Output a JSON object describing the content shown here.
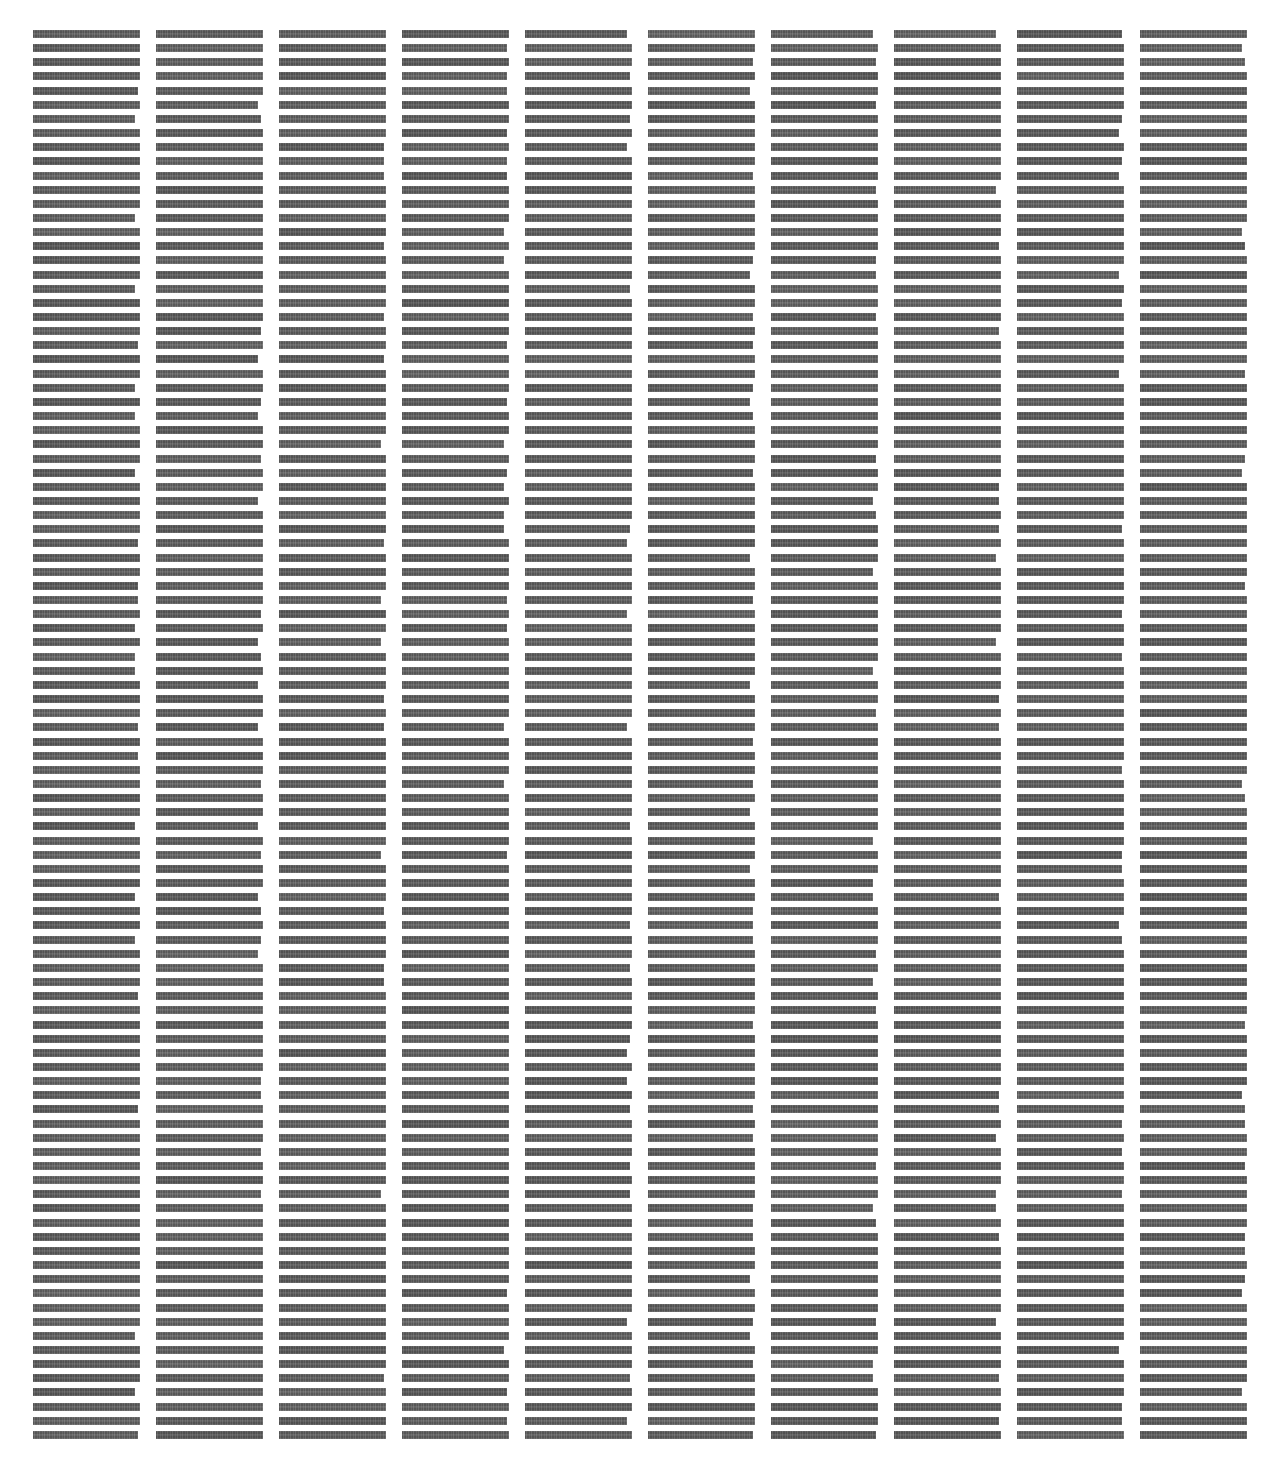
{
  "page": {
    "width": 1268,
    "height": 1464,
    "background_color": "#ffffff"
  },
  "appearance": {
    "redaction_color": "#545454",
    "line_height_px": 8,
    "line_pitch_px": 14.15,
    "column_count": 10,
    "column_width_px": 107,
    "column_pitch_px": 123,
    "first_column_left_px": 33,
    "first_line_top_px": 30,
    "lines_per_column": 100
  },
  "columns": [
    {
      "index": 1,
      "left": 33,
      "label": "redacted-text-column-1",
      "line_count": 100
    },
    {
      "index": 2,
      "left": 156,
      "label": "redacted-text-column-2",
      "line_count": 100
    },
    {
      "index": 3,
      "left": 279,
      "label": "redacted-text-column-3",
      "line_count": 100
    },
    {
      "index": 4,
      "left": 402,
      "label": "redacted-text-column-4",
      "line_count": 100
    },
    {
      "index": 5,
      "left": 525,
      "label": "redacted-text-column-5",
      "line_count": 100
    },
    {
      "index": 6,
      "left": 648,
      "label": "redacted-text-column-6",
      "line_count": 100
    },
    {
      "index": 7,
      "left": 771,
      "label": "redacted-text-column-7",
      "line_count": 100
    },
    {
      "index": 8,
      "left": 894,
      "label": "redacted-text-column-8",
      "line_count": 100
    },
    {
      "index": 9,
      "left": 1017,
      "label": "redacted-text-column-9",
      "line_count": 100
    },
    {
      "index": 10,
      "left": 1140,
      "label": "redacted-text-column-10",
      "line_count": 100
    }
  ]
}
